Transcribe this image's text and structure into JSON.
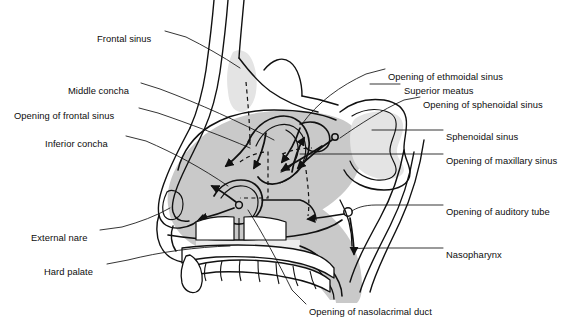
{
  "figure": {
    "colors": {
      "stroke": "#111111",
      "mucosa_fill": "#c9c9c9",
      "sinus_fill": "#e2e2e2",
      "background": "#ffffff",
      "label_text": "#0d0d0d"
    }
  },
  "labels": [
    {
      "id": "frontal-sinus",
      "text": "Frontal sinus",
      "x": 97,
      "y": 33,
      "align": "left"
    },
    {
      "id": "middle-concha",
      "text": "Middle concha",
      "x": 68,
      "y": 85,
      "align": "left"
    },
    {
      "id": "opening-of-frontal-sinus",
      "text": "Opening of frontal sinus",
      "x": 14,
      "y": 110,
      "align": "left"
    },
    {
      "id": "inferior-concha",
      "text": "Inferior concha",
      "x": 45,
      "y": 138,
      "align": "left"
    },
    {
      "id": "external-nare",
      "text": "External nare",
      "x": 31,
      "y": 232,
      "align": "left"
    },
    {
      "id": "hard-palate",
      "text": "Hard palate",
      "x": 44,
      "y": 266,
      "align": "left"
    },
    {
      "id": "opening-of-ethmoidal-sinus",
      "text": "Opening of ethmoidal sinus",
      "x": 388,
      "y": 71,
      "align": "left"
    },
    {
      "id": "superior-meatus",
      "text": "Superior meatus",
      "x": 404,
      "y": 85,
      "align": "left"
    },
    {
      "id": "opening-of-sphenoidal-sinus",
      "text": "Opening of sphenoidal sinus",
      "x": 423,
      "y": 99,
      "align": "left"
    },
    {
      "id": "sphenoidal-sinus",
      "text": "Sphenoidal sinus",
      "x": 446,
      "y": 131,
      "align": "left"
    },
    {
      "id": "opening-of-maxillary-sinus",
      "text": "Opening of maxillary sinus",
      "x": 446,
      "y": 155,
      "align": "left"
    },
    {
      "id": "opening-of-auditory-tube",
      "text": "Opening of auditory tube",
      "x": 446,
      "y": 206,
      "align": "left"
    },
    {
      "id": "nasopharynx",
      "text": "Nasopharynx",
      "x": 446,
      "y": 249,
      "align": "left"
    },
    {
      "id": "opening-of-nasolacrimal-duct",
      "text": "Opening of nasolacrimal duct",
      "x": 309,
      "y": 306,
      "align": "left"
    }
  ]
}
